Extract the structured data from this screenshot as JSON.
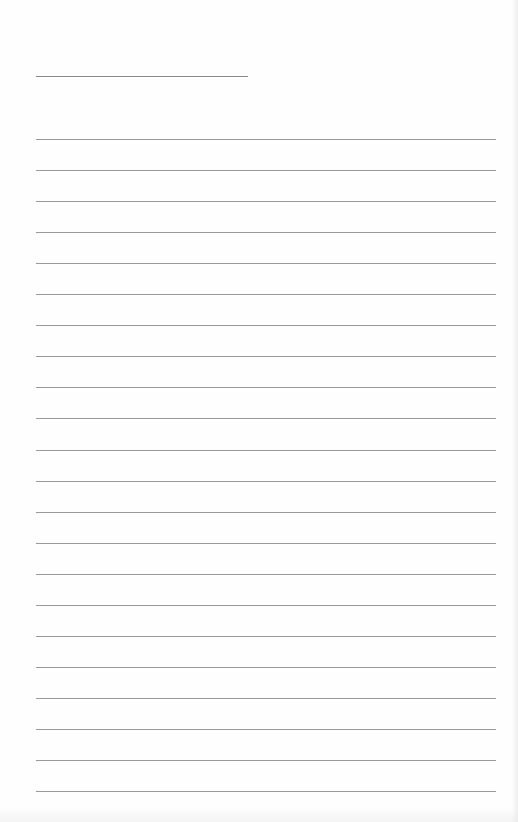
{
  "page": {
    "type": "lined-paper",
    "background": "#fefefe",
    "line_color": "#9a9a9a",
    "name_line": {
      "x": 36,
      "y": 76,
      "width": 212
    },
    "rules": {
      "x": 36,
      "width": 460,
      "first_y": 139,
      "spacing": 31.05,
      "count": 22
    }
  }
}
